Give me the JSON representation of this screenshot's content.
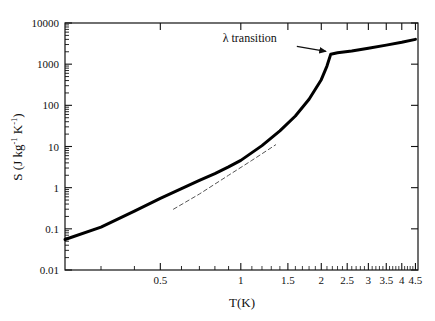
{
  "chart_data": {
    "type": "line",
    "title": "",
    "xlabel": "T(K)",
    "ylabel": "S (J kg-1 K-1)",
    "ylabel_parts": {
      "main": "S (J kg",
      "sup1": "-1",
      "mid": " K",
      "sup2": "-1",
      "close": ")"
    },
    "xscale": "log",
    "yscale": "log",
    "xlim": [
      0.22,
      4.6
    ],
    "ylim": [
      0.01,
      10000
    ],
    "grid": false,
    "legend": null,
    "xticks_major": [
      0.5,
      1,
      1.5,
      2,
      2.5,
      3,
      3.5,
      4,
      4.5
    ],
    "xtick_labels": [
      "0.5",
      "1",
      "1.5",
      "2",
      "2.5",
      "3",
      "3.5",
      "4",
      "4.5"
    ],
    "xticks_minor": [
      0.3,
      0.4,
      0.6,
      0.7,
      0.8,
      0.9
    ],
    "yticks_major": [
      0.01,
      0.1,
      1,
      10,
      100,
      1000,
      10000
    ],
    "ytick_labels": [
      "0.01",
      "0.1",
      "1",
      "10",
      "100",
      "1000",
      "10000"
    ],
    "series": [
      {
        "name": "entropy-curve",
        "style": "solid",
        "linewidth": 3,
        "color": "#000000",
        "points": [
          [
            0.22,
            0.055
          ],
          [
            0.3,
            0.11
          ],
          [
            0.4,
            0.27
          ],
          [
            0.5,
            0.55
          ],
          [
            0.6,
            0.95
          ],
          [
            0.7,
            1.5
          ],
          [
            0.8,
            2.2
          ],
          [
            0.9,
            3.2
          ],
          [
            1.0,
            4.6
          ],
          [
            1.2,
            10.5
          ],
          [
            1.4,
            24
          ],
          [
            1.6,
            55
          ],
          [
            1.8,
            140
          ],
          [
            2.0,
            420
          ],
          [
            2.1,
            900
          ],
          [
            2.17,
            1750
          ],
          [
            2.3,
            1900
          ],
          [
            2.6,
            2100
          ],
          [
            3.0,
            2450
          ],
          [
            3.5,
            2900
          ],
          [
            4.0,
            3400
          ],
          [
            4.5,
            4000
          ]
        ]
      },
      {
        "name": "phonon-extrapolation",
        "style": "dashed",
        "linewidth": 1,
        "color": "#555555",
        "points": [
          [
            0.56,
            0.3
          ],
          [
            0.7,
            0.7
          ],
          [
            0.9,
            2.0
          ],
          [
            1.1,
            4.6
          ],
          [
            1.35,
            11.0
          ]
        ]
      }
    ],
    "annotations": [
      {
        "name": "lambda-transition",
        "text": "λ transition",
        "text_x": 1.08,
        "text_y": 4300,
        "arrow_from": [
          1.62,
          2700
        ],
        "arrow_to": [
          2.08,
          2050
        ]
      }
    ]
  }
}
